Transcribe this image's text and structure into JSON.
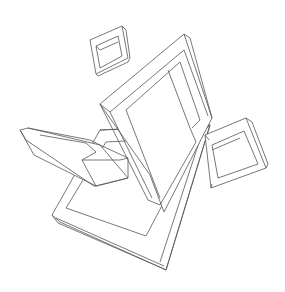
{
  "image": {
    "description": "Black-and-white line drawing of several interlocking 3D square frames (impossible-object style) floating at different angles",
    "background_color": "#ffffff",
    "stroke_color": "#555555",
    "elements": [
      {
        "name": "small-frame-top",
        "kind": "square frame"
      },
      {
        "name": "large-diamond-frame",
        "kind": "square frame"
      },
      {
        "name": "right-frame",
        "kind": "square frame"
      },
      {
        "name": "left-bar-frame",
        "kind": "square frame"
      },
      {
        "name": "bottom-large-frame",
        "kind": "square frame"
      }
    ]
  }
}
